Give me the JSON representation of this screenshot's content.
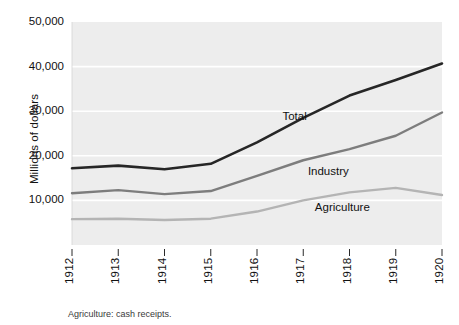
{
  "figure": {
    "y_axis_title": "Millions of dollars",
    "footnote": "Agriculture: cash receipts."
  },
  "chart_data": {
    "type": "line",
    "title": "",
    "subtitle": "",
    "xlabel": "",
    "ylabel": "Millions of dollars",
    "x": [
      1912,
      1913,
      1914,
      1915,
      1916,
      1917,
      1918,
      1919,
      1920
    ],
    "categories": [
      "1912",
      "1913",
      "1914",
      "1915",
      "1916",
      "1917",
      "1918",
      "1919",
      "1920"
    ],
    "xlim": [
      1912,
      1920
    ],
    "ylim": [
      0,
      50000
    ],
    "yticks": [
      10000,
      20000,
      30000,
      40000,
      50000
    ],
    "ytick_labels": [
      "10,000",
      "20,000",
      "30,000",
      "40,000",
      "50,000"
    ],
    "grid": "horizontal",
    "legend_position": "inline-labels",
    "plot_background": "#ededed",
    "gridline_color": "#ffffff",
    "series": [
      {
        "name": "Total",
        "color": "#262626",
        "width": 2.6,
        "label_x": 1916.55,
        "label_y": 28600,
        "values": [
          17200,
          17800,
          17000,
          18200,
          23000,
          28500,
          33500,
          37000,
          40700
        ]
      },
      {
        "name": "Industry",
        "color": "#7d7d7d",
        "width": 2.4,
        "label_x": 1917.1,
        "label_y": 16400,
        "values": [
          11600,
          12300,
          11400,
          12100,
          15500,
          19000,
          21500,
          24500,
          29700
        ]
      },
      {
        "name": "Agriculture",
        "color": "#b4b4b4",
        "width": 2.4,
        "label_x": 1917.25,
        "label_y": 8300,
        "values": [
          5800,
          5900,
          5600,
          5900,
          7500,
          10000,
          11800,
          12800,
          11200
        ]
      }
    ],
    "annotations": [
      {
        "text": "Total",
        "series": "Total"
      },
      {
        "text": "Industry",
        "series": "Industry"
      },
      {
        "text": "Agriculture",
        "series": "Agriculture"
      }
    ]
  }
}
